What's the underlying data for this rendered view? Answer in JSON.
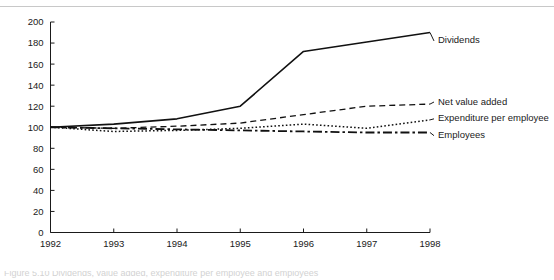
{
  "chart_data": {
    "type": "line",
    "title": "",
    "subtitle": "",
    "xlabel": "",
    "ylabel": "",
    "categories": [
      "1992",
      "1993",
      "1994",
      "1995",
      "1996",
      "1997",
      "1998"
    ],
    "x": [
      1992,
      1993,
      1994,
      1995,
      1996,
      1997,
      1998
    ],
    "xlim": [
      1992,
      1998
    ],
    "ylim": [
      0,
      200
    ],
    "y_ticks": [
      0,
      20,
      40,
      60,
      80,
      100,
      120,
      140,
      160,
      180,
      200
    ],
    "x_ticks": [
      "1992",
      "1993",
      "1994",
      "1995",
      "1996",
      "1997",
      "1998"
    ],
    "grid": false,
    "legend_position": "right-inline-labels",
    "series": [
      {
        "name": "Dividends",
        "style": "solid",
        "values": [
          100,
          103,
          108,
          120,
          172,
          181,
          190
        ]
      },
      {
        "name": "Net value added",
        "style": "dashed",
        "values": [
          100,
          99,
          101,
          104,
          112,
          120,
          122
        ]
      },
      {
        "name": "Expenditure per employee",
        "style": "dotted",
        "values": [
          100,
          96,
          97,
          99,
          103,
          99,
          107
        ]
      },
      {
        "name": "Employees",
        "style": "dash-dot",
        "values": [
          100,
          99,
          98,
          97,
          96,
          95,
          95
        ]
      }
    ]
  },
  "caption": {
    "text": "Figure 5.10 Dividends, value added, expenditure per employee and employees"
  },
  "colors": {
    "line": "#111111",
    "axis": "#1a1a1a",
    "rule": "#c8c8c8",
    "background": "#ffffff"
  }
}
